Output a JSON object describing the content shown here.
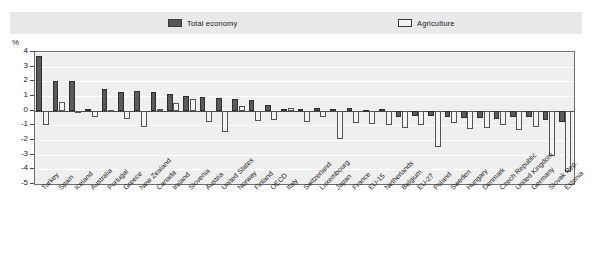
{
  "legend": {
    "total_label": "Total economy",
    "agriculture_label": "Agriculture",
    "total_color": "#575757",
    "agriculture_color": "#f2f2f2"
  },
  "axis": {
    "unit": "%",
    "yticks": [
      "4",
      "3",
      "2",
      "1",
      "0",
      "-1",
      "-2",
      "-3",
      "-4",
      "-5"
    ]
  },
  "chart_data": {
    "type": "bar",
    "title": "",
    "subtitle": "",
    "xlabel": "",
    "ylabel": "%",
    "ylim": [
      -5,
      4
    ],
    "ytick_step": 1,
    "grid": true,
    "legend_position": "top",
    "categories": [
      "Turkey",
      "Spain",
      "Iceland",
      "Australia",
      "Portugal",
      "Greece",
      "New Zealand",
      "Canada",
      "Ireland",
      "Slovenia",
      "Austria",
      "United States",
      "Norway",
      "Finland",
      "OECD",
      "Italy",
      "Switzerland",
      "Luxembourg",
      "Japan",
      "France",
      "EU-15",
      "Netherlands",
      "Belgium",
      "EU-27",
      "Poland",
      "Sweden",
      "Hungary",
      "Denmark",
      "Czech Republic",
      "United Kingdom",
      "Germany",
      "Slovak Rep.",
      "Estonia"
    ],
    "series": [
      {
        "name": "Total economy",
        "values": [
          3.7,
          2.0,
          2.0,
          0.15,
          1.5,
          1.3,
          1.35,
          1.25,
          1.15,
          1.0,
          0.95,
          0.85,
          0.8,
          0.75,
          0.4,
          0.1,
          0.15,
          0.2,
          0.1,
          0.2,
          0.05,
          0.15,
          -0.4,
          -0.35,
          -0.35,
          -0.4,
          -0.5,
          -0.5,
          -0.55,
          -0.45,
          -0.45,
          -0.65,
          -0.75
        ]
      },
      {
        "name": "Agriculture",
        "values": [
          -1.0,
          0.6,
          -0.1,
          -0.45,
          0.05,
          -0.6,
          -1.1,
          0.1,
          0.55,
          0.8,
          -0.75,
          -1.45,
          0.35,
          -0.7,
          -0.65,
          0.2,
          -0.75,
          -0.4,
          -1.9,
          -0.85,
          -0.9,
          -0.95,
          -1.15,
          -1.0,
          -2.5,
          -0.85,
          -1.25,
          -1.2,
          -1.0,
          -1.35,
          -1.1,
          -3.1,
          -4.2
        ]
      }
    ]
  }
}
